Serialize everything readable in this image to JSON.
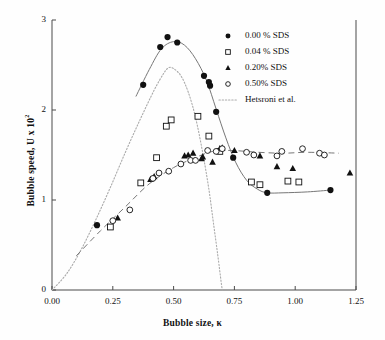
{
  "chart_data": {
    "type": "scatter",
    "title": "",
    "xlabel": "Bubble size, κ",
    "ylabel": "Bubble speed, U x 10",
    "ylabel_exponent": "2",
    "xlim": [
      0.0,
      1.25
    ],
    "ylim": [
      0,
      3
    ],
    "xticks": [
      "0.00",
      "0.25",
      "0.50",
      "0.75",
      "1.00",
      "1.25"
    ],
    "xtick_values": [
      0.0,
      0.25,
      0.5,
      0.75,
      1.0,
      1.25
    ],
    "yticks": [
      "0",
      "1",
      "2",
      "3"
    ],
    "ytick_values": [
      0,
      1,
      2,
      3
    ],
    "grid": false,
    "legend_position": "top-right",
    "series": [
      {
        "name": "0.00 % SDS",
        "marker": "filled-circle",
        "points": [
          [
            0.185,
            0.72
          ],
          [
            0.375,
            2.28
          ],
          [
            0.445,
            2.7
          ],
          [
            0.475,
            2.81
          ],
          [
            0.515,
            2.75
          ],
          [
            0.625,
            2.38
          ],
          [
            0.645,
            2.31
          ],
          [
            0.65,
            2.27
          ],
          [
            0.675,
            1.98
          ],
          [
            0.745,
            1.47
          ],
          [
            0.885,
            1.08
          ],
          [
            1.145,
            1.11
          ]
        ]
      },
      {
        "name": "0.04 % SDS",
        "marker": "open-square",
        "points": [
          [
            0.24,
            0.7
          ],
          [
            0.365,
            1.19
          ],
          [
            0.43,
            1.47
          ],
          [
            0.47,
            1.82
          ],
          [
            0.49,
            1.89
          ],
          [
            0.6,
            1.93
          ],
          [
            0.645,
            1.71
          ],
          [
            0.69,
            1.54
          ],
          [
            0.82,
            1.2
          ],
          [
            0.855,
            1.17
          ],
          [
            0.97,
            1.21
          ],
          [
            1.015,
            1.2
          ]
        ]
      },
      {
        "name": "0.20% SDS",
        "marker": "filled-triangle",
        "points": [
          [
            0.27,
            0.8
          ],
          [
            0.405,
            1.23
          ],
          [
            0.42,
            1.26
          ],
          [
            0.545,
            1.49
          ],
          [
            0.56,
            1.5
          ],
          [
            0.58,
            1.52
          ],
          [
            0.615,
            1.46
          ],
          [
            0.62,
            1.48
          ],
          [
            0.69,
            1.57
          ],
          [
            0.7,
            1.58
          ],
          [
            0.75,
            1.55
          ],
          [
            0.66,
            1.42
          ],
          [
            0.855,
            1.49
          ],
          [
            0.925,
            1.37
          ],
          [
            0.99,
            1.35
          ],
          [
            1.225,
            1.3
          ]
        ]
      },
      {
        "name": "0.50% SDS",
        "marker": "open-circle",
        "points": [
          [
            0.25,
            0.77
          ],
          [
            0.32,
            0.89
          ],
          [
            0.415,
            1.24
          ],
          [
            0.44,
            1.3
          ],
          [
            0.48,
            1.32
          ],
          [
            0.53,
            1.4
          ],
          [
            0.57,
            1.44
          ],
          [
            0.59,
            1.44
          ],
          [
            0.64,
            1.55
          ],
          [
            0.675,
            1.54
          ],
          [
            0.7,
            1.57
          ],
          [
            0.8,
            1.53
          ],
          [
            0.83,
            1.5
          ],
          [
            0.925,
            1.49
          ],
          [
            0.945,
            1.54
          ],
          [
            1.03,
            1.57
          ],
          [
            1.1,
            1.52
          ],
          [
            1.12,
            1.5
          ]
        ]
      }
    ],
    "model_curve": {
      "name": "Hetsroni et al.",
      "style": "dotted",
      "points": [
        [
          0.0,
          0.0
        ],
        [
          0.06,
          0.18
        ],
        [
          0.12,
          0.45
        ],
        [
          0.18,
          0.78
        ],
        [
          0.24,
          1.14
        ],
        [
          0.3,
          1.52
        ],
        [
          0.36,
          1.88
        ],
        [
          0.42,
          2.22
        ],
        [
          0.46,
          2.41
        ],
        [
          0.48,
          2.47
        ],
        [
          0.5,
          2.46
        ],
        [
          0.53,
          2.38
        ],
        [
          0.56,
          2.2
        ],
        [
          0.59,
          1.92
        ],
        [
          0.62,
          1.52
        ],
        [
          0.645,
          1.12
        ],
        [
          0.665,
          0.72
        ],
        [
          0.682,
          0.38
        ],
        [
          0.695,
          0.1
        ],
        [
          0.7,
          0.0
        ]
      ]
    },
    "fit_curves": [
      {
        "for_series": "0.00 % SDS",
        "style": "solid",
        "points": [
          [
            0.345,
            2.15
          ],
          [
            0.4,
            2.45
          ],
          [
            0.45,
            2.68
          ],
          [
            0.5,
            2.76
          ],
          [
            0.545,
            2.72
          ],
          [
            0.59,
            2.57
          ],
          [
            0.635,
            2.33
          ],
          [
            0.675,
            2.01
          ],
          [
            0.715,
            1.69
          ],
          [
            0.755,
            1.42
          ],
          [
            0.8,
            1.22
          ],
          [
            0.845,
            1.12
          ],
          [
            0.885,
            1.08
          ],
          [
            0.95,
            1.08
          ],
          [
            1.05,
            1.09
          ],
          [
            1.145,
            1.11
          ]
        ]
      },
      {
        "for_series": "0.50% SDS",
        "style": "dashed",
        "points": [
          [
            0.1,
            0.38
          ],
          [
            0.2,
            0.66
          ],
          [
            0.3,
            0.92
          ],
          [
            0.4,
            1.18
          ],
          [
            0.5,
            1.36
          ],
          [
            0.58,
            1.46
          ],
          [
            0.66,
            1.54
          ],
          [
            0.74,
            1.55
          ],
          [
            0.85,
            1.53
          ],
          [
            0.95,
            1.52
          ],
          [
            1.05,
            1.53
          ],
          [
            1.18,
            1.52
          ]
        ]
      }
    ]
  },
  "legend": {
    "entries": [
      {
        "label": "0.00 % SDS",
        "marker": "filled-circle"
      },
      {
        "label": "0.04 % SDS",
        "marker": "open-square"
      },
      {
        "label": "0.20% SDS",
        "marker": "filled-triangle"
      },
      {
        "label": "0.50% SDS",
        "marker": "open-circle"
      },
      {
        "label": "Hetsroni et al.",
        "marker": "dotted-line"
      }
    ]
  },
  "colors": {
    "axis": "#4a4a4a",
    "marker": "#111111",
    "fit_curve": "#777777",
    "model_curve": "#aaaaaa",
    "background": "#ffffff"
  }
}
